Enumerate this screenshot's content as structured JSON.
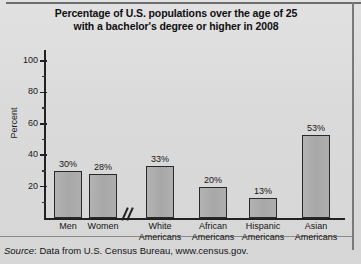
{
  "chart_data": {
    "type": "bar",
    "title": "Percentage of U.S. populations over the age of 25 with a bachelor's degree or higher in 2008",
    "title_line1": "Percentage of U.S. populations over the age of 25",
    "title_line2": "with a bachelor's degree or higher in 2008",
    "xlabel": "",
    "ylabel": "Percent",
    "ylim": [
      0,
      105
    ],
    "grid": false,
    "legend": false,
    "axis_break": true,
    "axis_break_note": "//",
    "categories": [
      "Men",
      "Women",
      "White Americans",
      "African Americans",
      "Hispanic Americans",
      "Asian Americans"
    ],
    "values": [
      30,
      28,
      33,
      20,
      13,
      53
    ],
    "value_labels": [
      "30%",
      "28%",
      "33%",
      "20%",
      "13%",
      "53%"
    ],
    "category_lines": [
      {
        "l1": "Men",
        "l2": ""
      },
      {
        "l1": "Women",
        "l2": ""
      },
      {
        "l1": "White",
        "l2": "Americans"
      },
      {
        "l1": "African",
        "l2": "Americans"
      },
      {
        "l1": "Hispanic",
        "l2": "Americans"
      },
      {
        "l1": "Asian",
        "l2": "Americans"
      }
    ],
    "yticks_major": [
      20,
      40,
      60,
      80,
      100
    ],
    "ytick_labels": [
      "20",
      "40",
      "60",
      "80",
      "100"
    ],
    "yticks_minor": [
      10,
      30,
      50,
      70,
      90
    ],
    "bar_fill_color": "#aeaeae",
    "bar_edge_color": "#2a2a2a",
    "background_color": "#dcdcdc"
  },
  "source": {
    "label": "Source",
    "separator": ": ",
    "text": "Data from U.S. Census Bureau, www.census.gov."
  }
}
